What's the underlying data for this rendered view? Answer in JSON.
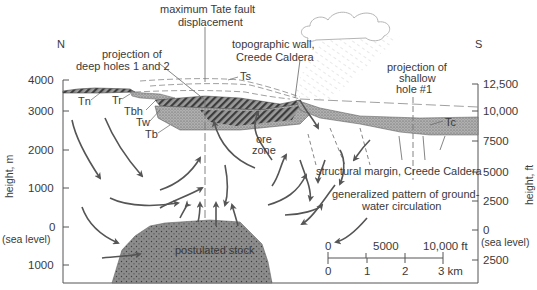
{
  "title": {
    "line1": "maximum Tate fault",
    "line2": "displacement"
  },
  "orientation": {
    "left": "N",
    "right": "S"
  },
  "left_axis": {
    "label": "height, m",
    "ticks": [
      {
        "value": "4000",
        "sub": ""
      },
      {
        "value": "3000",
        "sub": ""
      },
      {
        "value": "2000",
        "sub": ""
      },
      {
        "value": "1000",
        "sub": ""
      },
      {
        "value": "0",
        "sub": "(sea level)"
      },
      {
        "value": "1000",
        "sub": ""
      }
    ]
  },
  "right_axis": {
    "label": "height, ft",
    "ticks": [
      {
        "value": "12,500",
        "sub": ""
      },
      {
        "value": "10,000",
        "sub": ""
      },
      {
        "value": "7500",
        "sub": ""
      },
      {
        "value": "5000",
        "sub": ""
      },
      {
        "value": "2500",
        "sub": ""
      },
      {
        "value": "0",
        "sub": "(sea level)"
      },
      {
        "value": "2500",
        "sub": ""
      }
    ]
  },
  "annotations": {
    "deep_holes": {
      "line1": "projection of",
      "line2": "deep holes 1 and 2"
    },
    "topo_wall": {
      "line1": "topographic wall,",
      "line2": "Creede Caldera"
    },
    "shallow_hole": {
      "line1": "projection of",
      "line2": "shallow",
      "line3": "hole #1"
    },
    "ore_zone": {
      "line1": "ore",
      "line2": "zone"
    },
    "structural_margin": "structural margin, Creede Caldera",
    "groundwater": {
      "line1": "generalized pattern of ground-",
      "line2": "water circulation"
    },
    "stock": "postulated stock"
  },
  "units": {
    "Ts": "Ts",
    "Tn": "Tn",
    "Tr": "Tr",
    "Tbh": "Tbh",
    "Tw": "Tw",
    "Tb": "Tb",
    "Tc": "Tc"
  },
  "scale_bar": {
    "ft_labels": [
      "0",
      "5000",
      "10,000 ft"
    ],
    "km_labels": [
      "0",
      "1",
      "2",
      "3 km"
    ]
  },
  "colors": {
    "ink": "#3a3a3a",
    "stock_fill": "#8a8a8a",
    "stipple_fill": "#a9a9a9",
    "hatch_fill": "#6e6e6e",
    "background": "#ffffff"
  }
}
